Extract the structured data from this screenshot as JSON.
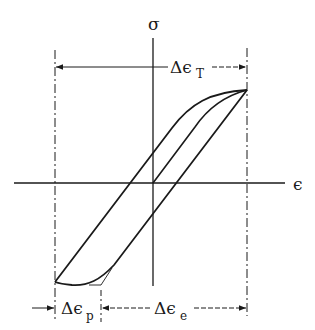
{
  "diagram": {
    "type": "stress-strain hysteresis loop",
    "axes": {
      "y_label": "σ",
      "x_label": "ϵ"
    },
    "dimensions": {
      "total_strain_range": {
        "symbol": "Δϵ",
        "subscript": "T"
      },
      "plastic_strain_range": {
        "symbol": "Δϵ",
        "subscript": "p"
      },
      "elastic_strain_range": {
        "symbol": "Δϵ",
        "subscript": "e"
      }
    },
    "colors": {
      "line": "#1a1a1a",
      "background": "#ffffff"
    }
  }
}
